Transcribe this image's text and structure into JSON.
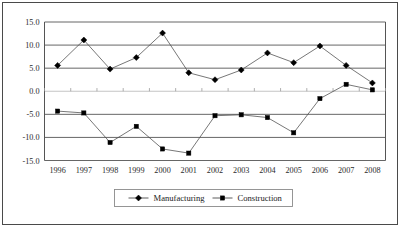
{
  "chart_data": {
    "type": "line",
    "title": "",
    "subtitle": "",
    "xlabel": "",
    "ylabel": "",
    "categories": [
      "1996",
      "1997",
      "1998",
      "1999",
      "2000",
      "2001",
      "2002",
      "2003",
      "2004",
      "2005",
      "2006",
      "2007",
      "2008"
    ],
    "series": [
      {
        "name": "Manufacturing",
        "marker": "diamond",
        "values": [
          5.6,
          11.1,
          4.8,
          7.3,
          12.6,
          4.0,
          2.5,
          4.6,
          8.3,
          6.2,
          9.8,
          5.6,
          1.8
        ]
      },
      {
        "name": "Construction",
        "marker": "square",
        "values": [
          -4.3,
          -4.7,
          -11.1,
          -7.6,
          -12.5,
          -13.4,
          -5.3,
          -5.1,
          -5.7,
          -9.0,
          -1.6,
          1.5,
          0.3
        ]
      }
    ],
    "ylim": [
      -15.0,
      15.0
    ],
    "yticks": [
      "15.0",
      "10.0",
      "5.0",
      "0.0",
      "-5.0",
      "-10.0",
      "-15.0"
    ],
    "ytick_values": [
      15.0,
      10.0,
      5.0,
      0.0,
      -5.0,
      -10.0,
      -15.0
    ],
    "grid": true,
    "legend_position": "bottom",
    "colors": {
      "line": "#4a4a4a",
      "marker": "#000000",
      "gridline": "#555555",
      "zeroline": "#bdbdbd",
      "frame": "#4a4a4a",
      "background": "#ffffff"
    }
  },
  "legend": {
    "entries": [
      {
        "label": "Manufacturing",
        "marker": "diamond"
      },
      {
        "label": "Construction",
        "marker": "square"
      }
    ]
  }
}
